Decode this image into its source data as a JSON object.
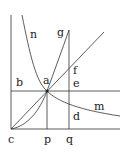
{
  "diagram": {
    "labels": {
      "n": "n",
      "g": "g",
      "f": "f",
      "b": "b",
      "a": "a",
      "e": "e",
      "m": "m",
      "d": "d",
      "c": "c",
      "p": "p",
      "q": "q"
    },
    "colors": {
      "line": "#333333",
      "background": "#ffffff"
    }
  }
}
